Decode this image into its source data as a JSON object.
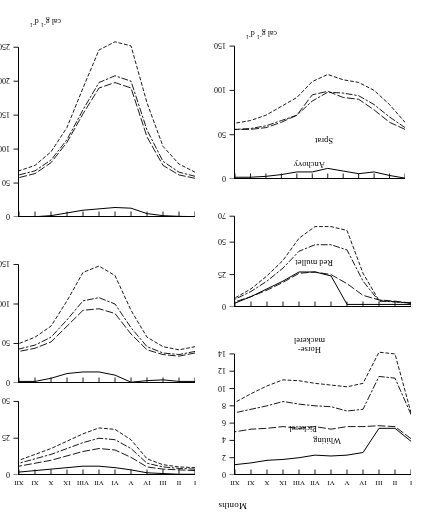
{
  "figure": {
    "orientation": "rotated-180",
    "x_axis_title": "Months",
    "y_unit_label_html": "cal g⁻¹ d⁻¹",
    "month_ticks": [
      "I",
      "II",
      "III",
      "IV",
      "V",
      "VI",
      "VII",
      "VIII",
      "IX",
      "X",
      "XI",
      "XII"
    ],
    "series_names": [
      "solid",
      "long-dash",
      "dash-dot",
      "short-dash"
    ]
  },
  "chart_data": [
    {
      "id": "whiting",
      "type": "line",
      "title": "Whiting",
      "xlabel": "Months",
      "ylabel": "cal g-1 d-1",
      "categories": [
        "I",
        "II",
        "III",
        "IV",
        "V",
        "VI",
        "VII",
        "VIII",
        "IX",
        "X",
        "XI",
        "XII"
      ],
      "yticks": [
        0,
        2,
        4,
        6,
        8,
        10,
        12,
        14
      ],
      "ylim": [
        0,
        14.8
      ],
      "y_inverted": true,
      "grid": false,
      "legend": "none",
      "series": [
        {
          "name": "solid",
          "style": "solid",
          "values": [
            3.9,
            5.4,
            5.4,
            2.6,
            2.3,
            2.2,
            2.3,
            2.0,
            1.8,
            1.7,
            1.4,
            1.2
          ]
        },
        {
          "name": "long-dash",
          "style": "long-dash",
          "values": [
            4.2,
            5.6,
            5.7,
            5.6,
            5.6,
            5.3,
            5.6,
            5.4,
            5.6,
            5.4,
            5.3,
            5.0
          ]
        },
        {
          "name": "dash-dot",
          "style": "dash-dot",
          "values": [
            7.0,
            11.2,
            11.4,
            7.6,
            7.4,
            7.9,
            8.0,
            8.2,
            8.5,
            8.0,
            7.6,
            7.2
          ]
        },
        {
          "name": "short-dash",
          "style": "short-dash",
          "values": [
            7.2,
            14.0,
            14.2,
            10.6,
            10.2,
            10.4,
            10.6,
            10.9,
            11.0,
            10.3,
            9.4,
            8.4
          ]
        }
      ]
    },
    {
      "id": "red-mullet",
      "type": "line",
      "title": "Red mullet",
      "xlabel": "Months",
      "ylabel": "cal g-1 d-1",
      "categories": [
        "I",
        "II",
        "III",
        "IV",
        "V",
        "VI",
        "VII",
        "VIII",
        "IX",
        "X",
        "XI",
        "XII"
      ],
      "yticks": [
        0,
        25,
        50,
        70
      ],
      "ylim": [
        0,
        74
      ],
      "y_inverted": true,
      "grid": false,
      "legend": "none",
      "series": [
        {
          "name": "solid",
          "style": "solid",
          "values": [
            2.0,
            2.0,
            2.0,
            2.0,
            2.0,
            24.0,
            27.0,
            27.0,
            20.0,
            14.0,
            8.0,
            3.0
          ]
        },
        {
          "name": "long-dash",
          "style": "long-dash",
          "values": [
            3.0,
            4.5,
            5.5,
            9.0,
            18.0,
            25.0,
            27.0,
            26.0,
            19.0,
            13.0,
            8.0,
            4.0
          ]
        },
        {
          "name": "dash-dot",
          "style": "dash-dot",
          "values": [
            3.0,
            4.0,
            4.5,
            20.0,
            44.0,
            48.0,
            48.0,
            43.0,
            30.0,
            20.0,
            12.0,
            6.0
          ]
        },
        {
          "name": "short-dash",
          "style": "short-dash",
          "values": [
            3.0,
            4.0,
            5.0,
            26.0,
            59.0,
            62.0,
            62.0,
            53.0,
            36.0,
            24.0,
            14.0,
            7.0
          ]
        }
      ]
    },
    {
      "id": "sprat",
      "type": "line",
      "title": "Sprat",
      "xlabel": "Months",
      "ylabel": "cal g-1 d-1",
      "categories": [
        "I",
        "II",
        "III",
        "IV",
        "V",
        "VI",
        "VII",
        "VIII",
        "IX",
        "X",
        "XI",
        "XII"
      ],
      "yticks": [
        0,
        50,
        100,
        150
      ],
      "ylim": [
        0,
        158
      ],
      "y_inverted": true,
      "grid": false,
      "legend": "none",
      "series": [
        {
          "name": "solid",
          "style": "solid",
          "values": [
            1.0,
            4.0,
            8.0,
            6.0,
            9.0,
            12.0,
            8.0,
            8.0,
            5.0,
            3.0,
            2.0,
            2.0
          ]
        },
        {
          "name": "long-dash",
          "style": "long-dash",
          "values": [
            56.0,
            64.0,
            78.0,
            90.0,
            92.0,
            99.0,
            95.0,
            72.0,
            64.0,
            58.0,
            56.0,
            56.0
          ]
        },
        {
          "name": "dash-dot",
          "style": "dash-dot",
          "values": [
            58.0,
            70.0,
            84.0,
            94.0,
            97.0,
            98.0,
            88.0,
            72.0,
            66.0,
            60.0,
            57.0,
            56.0
          ]
        },
        {
          "name": "short-dash",
          "style": "short-dash",
          "values": [
            64.0,
            84.0,
            100.0,
            109.0,
            112.0,
            118.0,
            110.0,
            92.0,
            82.0,
            72.0,
            66.0,
            63.0
          ]
        }
      ]
    },
    {
      "id": "pickerel",
      "type": "line",
      "title": "Pickerel",
      "xlabel": "Months",
      "ylabel": "cal g-1 d-1",
      "categories": [
        "I",
        "II",
        "III",
        "IV",
        "V",
        "VI",
        "VII",
        "VIII",
        "IX",
        "X",
        "XI",
        "XII"
      ],
      "yticks": [
        0,
        25,
        50
      ],
      "ylim": [
        0,
        53
      ],
      "y_inverted": true,
      "grid": false,
      "legend": "none",
      "series": [
        {
          "name": "solid",
          "style": "solid",
          "values": [
            0.5,
            0.5,
            1.0,
            1.5,
            3.5,
            5.0,
            6.0,
            6.0,
            5.0,
            4.0,
            3.0,
            2.0
          ]
        },
        {
          "name": "long-dash",
          "style": "long-dash",
          "values": [
            3.0,
            3.5,
            4.0,
            5.5,
            12.0,
            17.0,
            18.0,
            16.0,
            13.0,
            10.0,
            8.0,
            6.0
          ]
        },
        {
          "name": "dash-dot",
          "style": "dash-dot",
          "values": [
            4.0,
            4.5,
            5.5,
            8.0,
            18.0,
            24.0,
            25.0,
            22.0,
            18.0,
            14.0,
            11.0,
            8.0
          ]
        },
        {
          "name": "short-dash",
          "style": "short-dash",
          "values": [
            5.0,
            5.5,
            7.0,
            11.0,
            24.0,
            31.0,
            32.0,
            28.0,
            23.0,
            18.0,
            14.0,
            10.0
          ]
        }
      ]
    },
    {
      "id": "horse-mackerel",
      "type": "line",
      "title": "Horse-mackerel",
      "title_lines": [
        "Horse-",
        "mackerel"
      ],
      "xlabel": "Months",
      "ylabel": "cal g-1 d-1",
      "categories": [
        "I",
        "II",
        "III",
        "IV",
        "V",
        "VI",
        "VII",
        "VIII",
        "IX",
        "X",
        "XI",
        "XII"
      ],
      "yticks": [
        0,
        50,
        100,
        150
      ],
      "ylim": [
        0,
        162
      ],
      "y_inverted": true,
      "grid": false,
      "legend": "none",
      "series": [
        {
          "name": "solid",
          "style": "solid",
          "values": [
            2.0,
            2.0,
            4.0,
            3.0,
            1.0,
            10.0,
            14.0,
            14.0,
            12.0,
            6.0,
            2.0,
            2.0
          ]
        },
        {
          "name": "long-dash",
          "style": "long-dash",
          "values": [
            38.0,
            34.0,
            36.0,
            42.0,
            62.0,
            88.0,
            94.0,
            92.0,
            72.0,
            52.0,
            44.0,
            40.0
          ]
        },
        {
          "name": "dash-dot",
          "style": "dash-dot",
          "values": [
            40.0,
            36.0,
            38.0,
            46.0,
            70.0,
            100.0,
            108.0,
            104.0,
            80.0,
            58.0,
            48.0,
            43.0
          ]
        },
        {
          "name": "short-dash",
          "style": "short-dash",
          "values": [
            46.0,
            42.0,
            46.0,
            58.0,
            92.0,
            136.0,
            148.0,
            140.0,
            104.0,
            72.0,
            58.0,
            50.0
          ]
        }
      ]
    },
    {
      "id": "anchovy",
      "type": "line",
      "title": "Anchovy",
      "xlabel": "Months",
      "ylabel": "cal g-1 d-1",
      "categories": [
        "I",
        "II",
        "III",
        "IV",
        "V",
        "VI",
        "VII",
        "VIII",
        "IX",
        "X",
        "XI",
        "XII"
      ],
      "yticks": [
        0,
        50,
        100,
        150,
        200,
        250
      ],
      "ylim": [
        0,
        268
      ],
      "y_inverted": true,
      "grid": false,
      "legend": "none",
      "series": [
        {
          "name": "solid",
          "style": "solid",
          "values": [
            0.5,
            1.0,
            2.0,
            5.0,
            13.0,
            14.0,
            12.0,
            10.0,
            6.0,
            2.0,
            0.5,
            0.5
          ]
        },
        {
          "name": "long-dash",
          "style": "long-dash",
          "values": [
            57.0,
            62.0,
            76.0,
            118.0,
            190.0,
            198.0,
            190.0,
            152.0,
            110.0,
            80.0,
            64.0,
            58.0
          ]
        },
        {
          "name": "dash-dot",
          "style": "dash-dot",
          "values": [
            60.0,
            66.0,
            82.0,
            128.0,
            200.0,
            208.0,
            198.0,
            158.0,
            114.0,
            84.0,
            68.0,
            62.0
          ]
        },
        {
          "name": "short-dash",
          "style": "short-dash",
          "values": [
            66.0,
            78.0,
            104.0,
            168.0,
            252.0,
            258.0,
            246.0,
            190.0,
            132.0,
            96.0,
            76.0,
            68.0
          ]
        }
      ]
    }
  ]
}
